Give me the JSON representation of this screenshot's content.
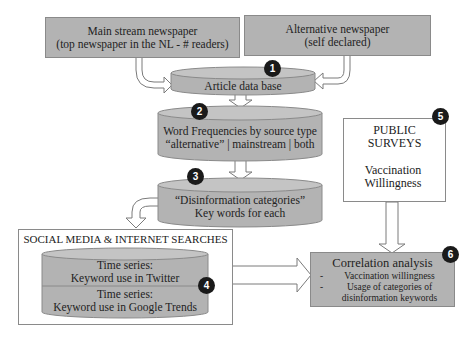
{
  "sources": {
    "mainstream": {
      "line1": "Main stream newspaper",
      "line2": "(top newspaper in the NL - # readers)"
    },
    "alternative": {
      "line1": "Alternative newspaper",
      "line2": "(self declared)"
    }
  },
  "steps": [
    {
      "number": "1",
      "line1": "Article data base"
    },
    {
      "number": "2",
      "line1": "Word Frequencies by source type",
      "line2": "“alternative” | mainstream | both"
    },
    {
      "number": "3",
      "line1": "“Disinformation categories”",
      "line2": "Key words for each"
    },
    {
      "number": "4",
      "container_title": "SOCIAL MEDIA & INTERNET SEARCHES",
      "twitter": {
        "line1": "Time series:",
        "line2": "Keyword use in Twitter"
      },
      "google": {
        "line1": "Time series:",
        "line2": "Keyword use in Google Trends"
      }
    },
    {
      "number": "5",
      "container_title_line1": "PUBLIC",
      "container_title_line2": "SURVEYS",
      "line1": "Vaccination",
      "line2": "Willingness"
    },
    {
      "number": "6",
      "title": "Correlation analysis",
      "bullets": [
        {
          "dash": "-",
          "text": "Vaccination willingness"
        },
        {
          "dash": "-",
          "text": "Usage of categories of",
          "text2": "disinformation keywords"
        }
      ]
    }
  ],
  "colors": {
    "fill": "#b3b3b3",
    "stroke": "#8a8a8a",
    "badge": "#1a1a1a",
    "background": "#ffffff"
  }
}
